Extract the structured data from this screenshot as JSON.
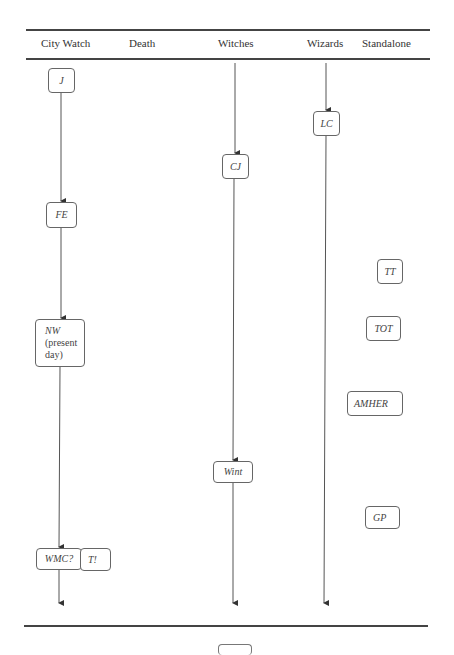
{
  "figure": {
    "columns": [
      {
        "label": "City Watch",
        "x": 58
      },
      {
        "label": "Death",
        "x": 150
      },
      {
        "label": "Witches",
        "x": 235
      },
      {
        "label": "Wizards",
        "x": 326
      },
      {
        "label": "Standalone",
        "x": 384
      }
    ],
    "nodes": [
      {
        "id": "J",
        "label": "J",
        "column": "City Watch"
      },
      {
        "id": "FE",
        "label": "FE",
        "column": "City Watch"
      },
      {
        "id": "NW",
        "label": "NW",
        "sublabel_1": "(present",
        "sublabel_2": "day)",
        "column": "City Watch"
      },
      {
        "id": "WMC",
        "label": "WMC?",
        "column": "City Watch"
      },
      {
        "id": "T",
        "label": "T!",
        "column": "City Watch"
      },
      {
        "id": "CJ",
        "label": "CJ",
        "column": "Witches"
      },
      {
        "id": "Wint",
        "label": "Wint",
        "column": "Witches"
      },
      {
        "id": "LC",
        "label": "LC",
        "column": "Wizards"
      },
      {
        "id": "TT",
        "label": "TT",
        "column": "Standalone"
      },
      {
        "id": "TOT",
        "label": "TOT",
        "column": "Standalone"
      },
      {
        "id": "AMHER",
        "label": "AMHER",
        "column": "Standalone"
      },
      {
        "id": "GP",
        "label": "GP",
        "column": "Standalone"
      }
    ],
    "edges": [
      {
        "from": "J",
        "to": "FE"
      },
      {
        "from": "FE",
        "to": "NW"
      },
      {
        "from": "NW",
        "to": "WMC"
      },
      {
        "from": "WMC",
        "to": "continues"
      },
      {
        "from": "top",
        "to": "CJ"
      },
      {
        "from": "CJ",
        "to": "Wint"
      },
      {
        "from": "Wint",
        "to": "continues"
      },
      {
        "from": "top",
        "to": "LC"
      },
      {
        "from": "LC",
        "to": "continues"
      }
    ],
    "colors": {
      "line": "#444444",
      "box_border": "#666666",
      "background": "#ffffff"
    }
  }
}
